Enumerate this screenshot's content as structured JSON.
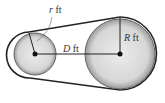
{
  "diagram": {
    "labels": {
      "small_radius": "r ft",
      "distance": "D ft",
      "large_radius": "R ft"
    },
    "small_radius_var": "r",
    "large_radius_var": "R",
    "distance_var": "D",
    "unit": "ft",
    "colors": {
      "belt": "#222222",
      "pulley_fill": "#d8d8d8",
      "pulley_edge": "#555555"
    }
  }
}
